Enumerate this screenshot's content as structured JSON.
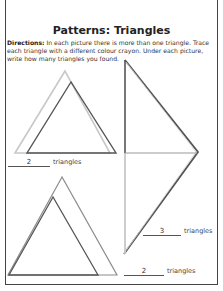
{
  "worksheet": {
    "title": "Patterns: Triangles",
    "directions_label": "Directions:",
    "directions_text": " In each picture there is more than one triangle. Trace each triangle with a different colour crayon. Under each picture, write how many triangles you found.",
    "pictures": [
      {
        "answer": "2",
        "unit": "triangles"
      },
      {
        "answer": "3",
        "unit": "triangles"
      },
      {
        "answer": "2",
        "unit": "triangles"
      }
    ]
  },
  "colors": {
    "light_line": "#c4c4c4",
    "dark_line": "#555555",
    "border": "#444444"
  }
}
